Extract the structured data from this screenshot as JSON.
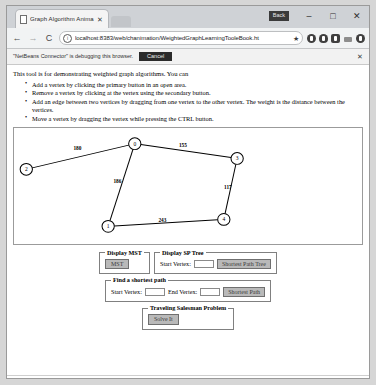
{
  "window": {
    "badge_label": "Back",
    "minimize_label": "–",
    "maximize_label": "□",
    "close_label": "✕"
  },
  "tab": {
    "title": "Graph Algorithm Anima",
    "close_label": "✕",
    "favicon_name": "page-icon",
    "new_tab_label": ""
  },
  "navbar": {
    "back_label": "←",
    "forward_label": "→",
    "reload_label": "C",
    "info_label": "i",
    "url": "localhost:8383/web/chanimation/WeightedGraphLearningTooleBook.ht",
    "star_label": "★"
  },
  "infobar": {
    "message": "\"NetBeans Connector\" is debugging this browser.",
    "cancel_label": "Cancel",
    "close_label": "✕"
  },
  "page": {
    "intro": "This tool is for demonstrating weighted graph algorithms. You can",
    "instructions": [
      "Add a vertex by clicking the primary button in an open area.",
      "Remove a vertex by clicking at the vertex using the secondary button.",
      "Add an edge between two vertices by dragging from one vertex to the other vertex. The weight is the distance between the vertices.",
      "Move a vertex by dragging the vertex while pressing the CTRL button."
    ]
  },
  "graph": {
    "vertices": [
      {
        "id": "0",
        "label": "0",
        "x": 118,
        "y": 16
      },
      {
        "id": "1",
        "label": "1",
        "x": 92,
        "y": 100
      },
      {
        "id": "2",
        "label": "2",
        "x": 12,
        "y": 42
      },
      {
        "id": "3",
        "label": "3",
        "x": 218,
        "y": 31
      },
      {
        "id": "4",
        "label": "4",
        "x": 205,
        "y": 93
      }
    ],
    "edges": [
      {
        "from": "2",
        "to": "0",
        "weight": "180",
        "lx": 62,
        "ly": 22
      },
      {
        "from": "0",
        "to": "3",
        "weight": "155",
        "lx": 165,
        "ly": 19
      },
      {
        "from": "0",
        "to": "1",
        "weight": "186",
        "lx": 101,
        "ly": 56
      },
      {
        "from": "3",
        "to": "4",
        "weight": "117",
        "lx": 209,
        "ly": 62
      },
      {
        "from": "1",
        "to": "4",
        "weight": "243",
        "lx": 145,
        "ly": 96
      }
    ],
    "node_radius": 6
  },
  "panels": {
    "mst": {
      "legend": "Display MST",
      "button_label": "MST"
    },
    "sp_tree": {
      "legend": "Display SP Tree",
      "start_vertex_label": "Start Vertex:",
      "start_vertex_value": "",
      "button_label": "Shortest Path Tree"
    },
    "shortest_path": {
      "legend": "Find a shortest path",
      "start_vertex_label": "Start Vertex:",
      "start_vertex_value": "",
      "end_vertex_label": "End Vertex:",
      "end_vertex_value": "",
      "button_label": "Shortest Path"
    },
    "tsp": {
      "legend": "Traveling Salesman Problem",
      "button_label": "Solve It"
    }
  }
}
